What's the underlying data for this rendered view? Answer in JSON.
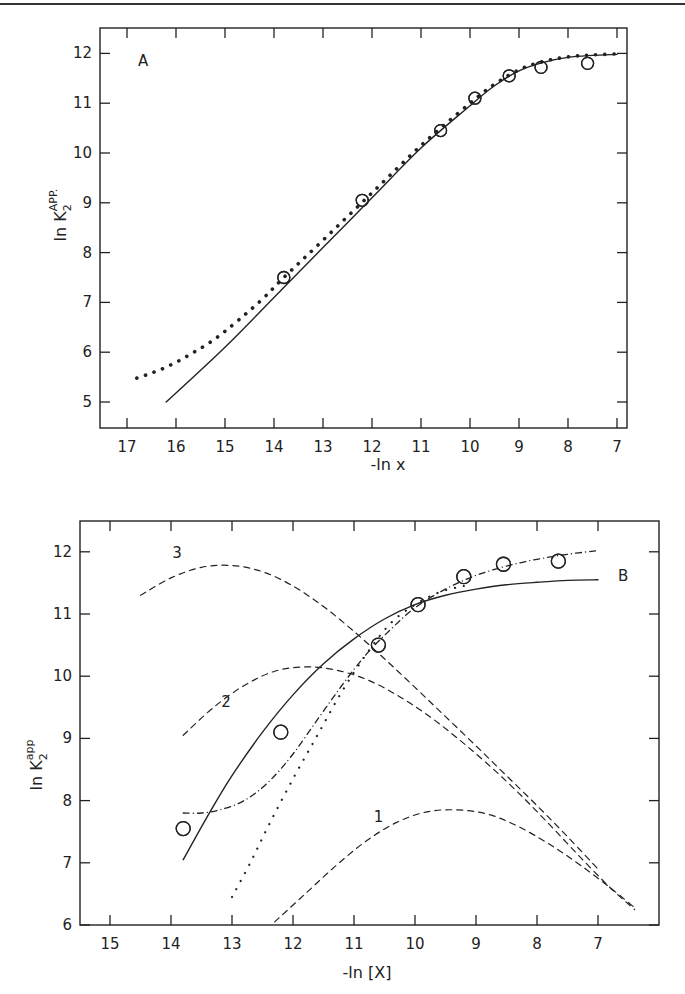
{
  "chart_data": [
    {
      "type": "line",
      "panel": "A",
      "panel_label": "A",
      "xlabel": "-ln x",
      "ylabel": "ln K2APP.",
      "ylabel_main": "ln K",
      "ylabel_sub": "2",
      "ylabel_sup": "APP.",
      "x_reversed": true,
      "xlim": [
        17.5,
        6.8
      ],
      "ylim": [
        4.5,
        12.5
      ],
      "x_ticks": [
        17,
        16,
        15,
        14,
        13,
        12,
        11,
        10,
        9,
        8,
        7
      ],
      "y_ticks": [
        5,
        6,
        7,
        8,
        9,
        10,
        11,
        12
      ],
      "grid": false,
      "series": [
        {
          "name": "experimental",
          "style": "open-circles",
          "x": [
            13.8,
            12.2,
            10.6,
            9.9,
            9.2,
            8.55,
            7.6
          ],
          "y": [
            7.5,
            9.05,
            10.45,
            11.1,
            11.55,
            11.72,
            11.8
          ]
        },
        {
          "name": "solid-fit",
          "style": "solid",
          "x": [
            16.2,
            15.0,
            14.0,
            13.0,
            12.0,
            11.0,
            10.0,
            9.5,
            9.0,
            8.5,
            8.0,
            7.5,
            7.0
          ],
          "y": [
            5.0,
            6.1,
            7.1,
            8.1,
            9.1,
            10.1,
            10.95,
            11.35,
            11.65,
            11.82,
            11.92,
            11.96,
            11.98
          ]
        },
        {
          "name": "dotted-fit",
          "style": "dotted",
          "x": [
            16.8,
            16.5,
            16.2,
            15.9,
            15.6,
            15.3,
            15.0,
            14.6,
            14.2,
            13.8,
            13.0,
            12.0,
            11.0,
            10.0,
            9.5,
            9.0,
            8.5,
            8.0,
            7.5,
            7.0
          ],
          "y": [
            5.48,
            5.58,
            5.7,
            5.85,
            6.02,
            6.2,
            6.42,
            6.75,
            7.1,
            7.5,
            8.25,
            9.2,
            10.15,
            11.0,
            11.38,
            11.67,
            11.84,
            11.93,
            11.97,
            11.99
          ]
        }
      ]
    },
    {
      "type": "line",
      "panel": "B",
      "panel_label": "B",
      "xlabel": "-ln [X]",
      "ylabel": "ln K2app",
      "ylabel_main": "ln K",
      "ylabel_sub": "2",
      "ylabel_sup": "app",
      "x_reversed": true,
      "xlim": [
        15.5,
        6.0
      ],
      "ylim": [
        6,
        12.5
      ],
      "x_ticks": [
        15,
        14,
        13,
        12,
        11,
        10,
        9,
        8,
        7
      ],
      "y_ticks": [
        6,
        7,
        8,
        9,
        10,
        11,
        12
      ],
      "grid": false,
      "curve_labels": [
        {
          "text": "3",
          "x": 13.9,
          "y": 11.9
        },
        {
          "text": "2",
          "x": 13.1,
          "y": 9.5
        },
        {
          "text": "1",
          "x": 10.6,
          "y": 7.65
        }
      ],
      "series": [
        {
          "name": "experimental",
          "style": "open-circles",
          "x": [
            13.8,
            12.2,
            10.6,
            9.95,
            9.2,
            8.55,
            7.65
          ],
          "y": [
            7.55,
            9.1,
            10.5,
            11.15,
            11.6,
            11.8,
            11.85
          ]
        },
        {
          "name": "solid-fit",
          "style": "solid",
          "x": [
            13.8,
            13.4,
            13.0,
            12.5,
            12.0,
            11.5,
            11.0,
            10.5,
            10.0,
            9.5,
            9.0,
            8.5,
            8.0,
            7.5,
            7.0
          ],
          "y": [
            7.05,
            7.75,
            8.4,
            9.1,
            9.7,
            10.2,
            10.6,
            10.92,
            11.15,
            11.3,
            11.4,
            11.47,
            11.51,
            11.54,
            11.55
          ]
        },
        {
          "name": "dash-dot-fit",
          "style": "dash-dot",
          "x": [
            13.8,
            13.5,
            13.2,
            12.8,
            12.4,
            12.0,
            11.6,
            11.2,
            10.8,
            10.4,
            10.0,
            9.5,
            9.0,
            8.5,
            8.0,
            7.5,
            7.0
          ],
          "y": [
            7.8,
            7.8,
            7.85,
            8.0,
            8.3,
            8.75,
            9.3,
            9.85,
            10.35,
            10.75,
            11.1,
            11.4,
            11.62,
            11.77,
            11.88,
            11.96,
            12.02
          ]
        },
        {
          "name": "dotted-fit",
          "style": "dotted",
          "x": [
            13.0,
            12.7,
            12.4,
            12.0,
            11.6,
            11.2,
            10.8,
            10.4,
            10.0,
            9.6,
            9.2
          ],
          "y": [
            6.45,
            7.0,
            7.6,
            8.35,
            9.05,
            9.75,
            10.35,
            10.85,
            11.15,
            11.35,
            11.45
          ]
        },
        {
          "name": "curve-3",
          "style": "dashed",
          "x": [
            14.5,
            14.0,
            13.5,
            13.0,
            12.5,
            12.0,
            11.5,
            11.0,
            10.5,
            10.0,
            9.5,
            9.0,
            8.5,
            8.0,
            7.5,
            7.0
          ],
          "y": [
            11.3,
            11.58,
            11.75,
            11.78,
            11.68,
            11.45,
            11.12,
            10.72,
            10.28,
            9.82,
            9.35,
            8.88,
            8.4,
            7.92,
            7.42,
            6.9
          ]
        },
        {
          "name": "curve-2",
          "style": "dashed",
          "x": [
            13.8,
            13.3,
            12.8,
            12.3,
            11.8,
            11.3,
            10.8,
            10.3,
            9.8,
            9.3,
            8.8,
            8.3,
            7.8,
            7.3,
            6.8,
            6.4
          ],
          "y": [
            9.05,
            9.5,
            9.85,
            10.08,
            10.15,
            10.1,
            9.95,
            9.7,
            9.38,
            9.0,
            8.58,
            8.12,
            7.62,
            7.1,
            6.6,
            6.25
          ]
        },
        {
          "name": "curve-1",
          "style": "dashed",
          "x": [
            12.3,
            11.8,
            11.3,
            10.8,
            10.3,
            9.8,
            9.3,
            8.8,
            8.3,
            7.8,
            7.3,
            6.8,
            6.4
          ],
          "y": [
            6.05,
            6.5,
            6.95,
            7.35,
            7.65,
            7.82,
            7.85,
            7.78,
            7.58,
            7.3,
            6.97,
            6.6,
            6.28
          ]
        }
      ]
    }
  ]
}
